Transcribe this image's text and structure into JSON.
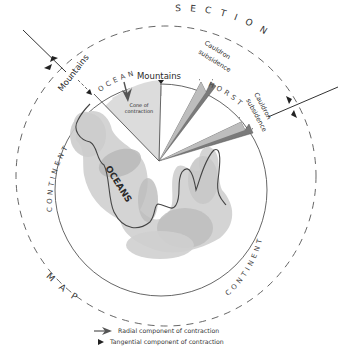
{
  "labels": {
    "section": "SECTION",
    "map": "MAP",
    "continent_left": "CONTINENT",
    "continent_right": "CONTINENT",
    "ocean": "OCEAN",
    "horst": "HORST",
    "mountains_left": "Mountains",
    "mountains_top": "Mountains",
    "cauldron_1_line1": "Cauldron",
    "cauldron_1_line2": "subsidence",
    "cauldron_2_line1": "Cauldron",
    "cauldron_2_line2": "subsidence",
    "cone_line1": "Cone of",
    "cone_line2": "contraction",
    "oceans": "OCEANS"
  },
  "legend": {
    "radial": "Radial component of contraction",
    "tangential": "Tangential component of contraction"
  },
  "icons": {
    "radial_arrow": "radial-arrow-icon",
    "tangential_arrow": "tangential-arrow-icon"
  },
  "colors": {
    "cone_fill": "#d9d9d9",
    "ocean_fill": "#cfcfcf",
    "ocean_dark": "#b3b3b3",
    "wedge_fill": "#7a7a7a",
    "line": "#444444"
  }
}
